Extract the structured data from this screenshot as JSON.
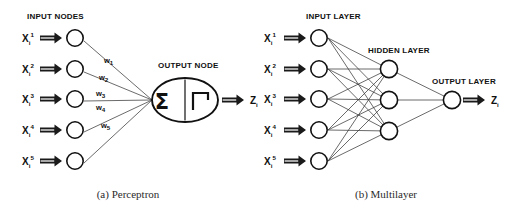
{
  "figure": {
    "background": "#ffffff",
    "ink": "#111111",
    "link_color": "#3a3a3a"
  },
  "panel_a": {
    "caption": "(a) Perceptron",
    "input_heading": "INPUT NODES",
    "output_heading": "OUTPUT NODE",
    "inputs": [
      {
        "base": "X",
        "sub": "i",
        "sup": "1"
      },
      {
        "base": "X",
        "sub": "i",
        "sup": "2"
      },
      {
        "base": "X",
        "sub": "i",
        "sup": "3"
      },
      {
        "base": "X",
        "sub": "i",
        "sup": "4"
      },
      {
        "base": "X",
        "sub": "i",
        "sup": "5"
      }
    ],
    "weights": [
      {
        "base": "w",
        "sub": "1"
      },
      {
        "base": "w",
        "sub": "2"
      },
      {
        "base": "w",
        "sub": "3"
      },
      {
        "base": "w",
        "sub": "4"
      },
      {
        "base": "w",
        "sub": "5"
      }
    ],
    "summation_symbol": "Σ",
    "activation_symbol": "step-function",
    "output": {
      "base": "Z",
      "sub": "i"
    }
  },
  "panel_b": {
    "caption": "(b) Multilayer",
    "input_heading": "INPUT LAYER",
    "hidden_heading": "HIDDEN LAYER",
    "output_heading": "OUTPUT LAYER",
    "inputs": [
      {
        "base": "X",
        "sub": "i",
        "sup": "1"
      },
      {
        "base": "X",
        "sub": "i",
        "sup": "2"
      },
      {
        "base": "X",
        "sub": "i",
        "sup": "3"
      },
      {
        "base": "X",
        "sub": "i",
        "sup": "4"
      },
      {
        "base": "X",
        "sub": "i",
        "sup": "5"
      }
    ],
    "input_node_count": 5,
    "hidden_node_count": 3,
    "output_node_count": 1,
    "output": {
      "base": "Z",
      "sub": "i"
    }
  }
}
